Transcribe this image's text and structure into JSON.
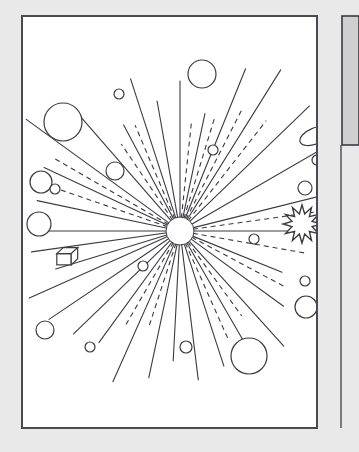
{
  "canvas": {
    "width": 359,
    "height": 452,
    "background": "#e9e9e9"
  },
  "colors": {
    "background": "#e9e9e9",
    "paper": "#ffffff",
    "ink": "#3a3a42",
    "border": "#4a4a52",
    "panel_gray": "#cfcfcf",
    "panel_gray_border": "#3a3a42"
  },
  "figure": {
    "paper_frame": {
      "x": 22,
      "y": 16,
      "width": 295,
      "height": 412,
      "stroke_width": 2
    },
    "side_panel": {
      "x": 342,
      "y": 16,
      "width": 17,
      "height": 129,
      "label": "gray-side-panel"
    },
    "side_divider": {
      "x": 341,
      "y": 145,
      "height": 283
    }
  },
  "chart_data": {
    "type": "scatter",
    "xlabel": "",
    "ylabel": "",
    "center": {
      "cx": 180,
      "cy": 231,
      "r": 14,
      "label": "central-burst-core"
    },
    "rays_solid": [
      {
        "angle_deg": -90,
        "length": 150,
        "end_node": "circle-top-center"
      },
      {
        "angle_deg": -78,
        "length": 120,
        "end_node": "dot-upper-right-inner"
      },
      {
        "angle_deg": -68,
        "length": 175,
        "end_node": null
      },
      {
        "angle_deg": -58,
        "length": 190,
        "end_node": null
      },
      {
        "angle_deg": -100,
        "length": 132,
        "end_node": null
      },
      {
        "angle_deg": -108,
        "length": 160,
        "end_node": "dot-upper-left"
      },
      {
        "angle_deg": -118,
        "length": 120,
        "end_node": null
      },
      {
        "angle_deg": -131,
        "length": 152,
        "end_node": "circle-left-upper-mid"
      },
      {
        "angle_deg": -144,
        "length": 190,
        "end_node": null
      },
      {
        "angle_deg": -155,
        "length": 150,
        "end_node": "circle-pair-small"
      },
      {
        "angle_deg": -168,
        "length": 146,
        "end_node": null
      },
      {
        "angle_deg": 180,
        "length": 142,
        "end_node": "circle-left-mid"
      },
      {
        "angle_deg": 172,
        "length": 150,
        "end_node": null
      },
      {
        "angle_deg": 163,
        "length": 130,
        "end_node": "cube-left"
      },
      {
        "angle_deg": 156,
        "length": 165,
        "end_node": null
      },
      {
        "angle_deg": 146,
        "length": 158,
        "end_node": null
      },
      {
        "angle_deg": 136,
        "length": 148,
        "end_node": "circle-lower-left"
      },
      {
        "angle_deg": 126,
        "length": 138,
        "end_node": "dot-lower-left"
      },
      {
        "angle_deg": 114,
        "length": 165,
        "end_node": null
      },
      {
        "angle_deg": 102,
        "length": 150,
        "end_node": null
      },
      {
        "angle_deg": 93,
        "length": 130,
        "end_node": "dot-bottom-center"
      },
      {
        "angle_deg": 83,
        "length": 150,
        "end_node": null
      },
      {
        "angle_deg": 72,
        "length": 142,
        "end_node": "circle-bottom-right-large"
      },
      {
        "angle_deg": 60,
        "length": 140,
        "end_node": null
      },
      {
        "angle_deg": 48,
        "length": 155,
        "end_node": "circle-right-lower"
      },
      {
        "angle_deg": 36,
        "length": 128,
        "end_node": "dot-right-lower"
      },
      {
        "angle_deg": 22,
        "length": 110,
        "end_node": "dot-right-inner"
      },
      {
        "angle_deg": 0,
        "length": 165,
        "end_node": "starburst-right"
      },
      {
        "angle_deg": -14,
        "length": 145,
        "end_node": "circle-right-mid"
      },
      {
        "angle_deg": -30,
        "length": 165,
        "end_node": "ellipse-top-right"
      },
      {
        "angle_deg": -44,
        "length": 180,
        "end_node": null
      }
    ],
    "rays_dashed": [
      {
        "angle_deg": -84,
        "length": 108
      },
      {
        "angle_deg": -73,
        "length": 118
      },
      {
        "angle_deg": -63,
        "length": 135
      },
      {
        "angle_deg": -52,
        "length": 140
      },
      {
        "angle_deg": -113,
        "length": 115
      },
      {
        "angle_deg": -124,
        "length": 105
      },
      {
        "angle_deg": -150,
        "length": 145
      },
      {
        "angle_deg": -161,
        "length": 130
      },
      {
        "angle_deg": 120,
        "length": 110
      },
      {
        "angle_deg": 108,
        "length": 100
      },
      {
        "angle_deg": 66,
        "length": 118
      },
      {
        "angle_deg": 54,
        "length": 105
      },
      {
        "angle_deg": 28,
        "length": 118
      },
      {
        "angle_deg": 10,
        "length": 130
      },
      {
        "angle_deg": -8,
        "length": 140
      }
    ],
    "nodes": [
      {
        "name": "circle-top-center",
        "shape": "circle",
        "cx": 202,
        "cy": 74,
        "r": 14
      },
      {
        "name": "dot-upper-left",
        "shape": "circle",
        "cx": 119,
        "cy": 94,
        "r": 5
      },
      {
        "name": "circle-upper-left-large",
        "shape": "circle",
        "cx": 63,
        "cy": 122,
        "r": 19
      },
      {
        "name": "circle-left-upper-mid",
        "shape": "circle",
        "cx": 115,
        "cy": 171,
        "r": 9
      },
      {
        "name": "circle-left-pair-big",
        "shape": "circle",
        "cx": 41,
        "cy": 182,
        "r": 11
      },
      {
        "name": "circle-pair-small",
        "shape": "circle",
        "cx": 55,
        "cy": 189,
        "r": 5
      },
      {
        "name": "circle-left-mid",
        "shape": "circle",
        "cx": 39,
        "cy": 224,
        "r": 12
      },
      {
        "name": "cube-left",
        "shape": "cube",
        "cx": 64,
        "cy": 257,
        "r": 9
      },
      {
        "name": "circle-lower-left",
        "shape": "circle",
        "cx": 45,
        "cy": 330,
        "r": 9
      },
      {
        "name": "dot-lower-left",
        "shape": "circle",
        "cx": 90,
        "cy": 347,
        "r": 5
      },
      {
        "name": "dot-bottom-center",
        "shape": "circle",
        "cx": 186,
        "cy": 347,
        "r": 6
      },
      {
        "name": "circle-bottom-right-large",
        "shape": "circle",
        "cx": 249,
        "cy": 356,
        "r": 18
      },
      {
        "name": "circle-right-lower",
        "shape": "circle",
        "cx": 306,
        "cy": 307,
        "r": 11
      },
      {
        "name": "dot-right-far-lower",
        "shape": "circle",
        "cx": 333,
        "cy": 322,
        "r": 5
      },
      {
        "name": "dot-right-lower",
        "shape": "circle",
        "cx": 305,
        "cy": 281,
        "r": 5
      },
      {
        "name": "dot-right-inner",
        "shape": "circle",
        "cx": 254,
        "cy": 239,
        "r": 5
      },
      {
        "name": "starburst-right",
        "shape": "starburst",
        "cx": 302,
        "cy": 224,
        "r": 19,
        "points": 12
      },
      {
        "name": "circle-right-mid",
        "shape": "circle",
        "cx": 305,
        "cy": 188,
        "r": 7
      },
      {
        "name": "dot-right-upper",
        "shape": "circle",
        "cx": 317,
        "cy": 160,
        "r": 5
      },
      {
        "name": "ellipse-top-right",
        "shape": "ellipse",
        "cx": 315,
        "cy": 136,
        "rx": 16,
        "ry": 8,
        "rotate_deg": -22
      },
      {
        "name": "dot-upper-right-inner",
        "shape": "circle",
        "cx": 213,
        "cy": 150,
        "r": 5
      },
      {
        "name": "dot-mid-lower-left",
        "shape": "circle",
        "cx": 143,
        "cy": 266,
        "r": 5
      }
    ]
  }
}
